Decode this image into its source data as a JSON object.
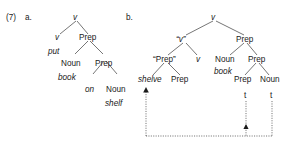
{
  "figure": {
    "example_number": "(7)",
    "subfigures": [
      {
        "label": "a."
      },
      {
        "label": "b."
      }
    ]
  },
  "tree_a": {
    "nodes": {
      "root_v": "v",
      "v_left": "v",
      "prep_1": "Prep",
      "noun_1": "Noun",
      "prep_2": "Prep",
      "prep_on": "on",
      "noun_2": "Noun"
    },
    "terminals": {
      "put": "put",
      "book": "book",
      "shelf": "shelf"
    }
  },
  "tree_b": {
    "nodes": {
      "root_v": "v",
      "v_quoted": "“v”",
      "prep_quoted": "“Prep”",
      "v_bare": "v",
      "prep_right": "Prep",
      "noun_book": "Noun",
      "prep_inner": "Prep",
      "prep_trace_node": "Prep",
      "noun_trace_node": "Noun",
      "prep_under_shelve": "Prep"
    },
    "terminals": {
      "shelve": "shelve",
      "book": "book",
      "trace_prep": "t",
      "trace_noun": "t"
    }
  },
  "colors": {
    "ink": "#1a1a1a",
    "background": "#ffffff"
  }
}
